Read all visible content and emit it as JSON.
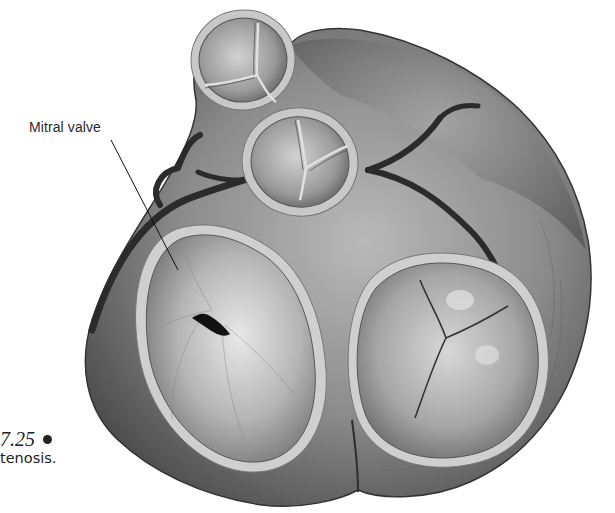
{
  "figure": {
    "labels": {
      "mitral_valve": "Mitral valve"
    },
    "caption": {
      "figure_number": "7.25",
      "text_fragment": "tenosis."
    },
    "structures": [
      {
        "name": "pulmonic-valve",
        "position": "top"
      },
      {
        "name": "aortic-valve",
        "position": "center-top"
      },
      {
        "name": "mitral-valve",
        "position": "bottom-left",
        "state": "stenotic (narrowed fish-mouth opening)"
      },
      {
        "name": "tricuspid-valve",
        "position": "bottom-right"
      }
    ],
    "colors": {
      "background": "#ffffff",
      "tissue_dark": "#3a3a3a",
      "tissue_mid": "#7a7a7a",
      "tissue_light": "#b8b8b8",
      "valve_ring": "#c9c9c9",
      "text": "#222222"
    }
  }
}
